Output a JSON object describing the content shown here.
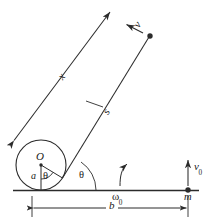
{
  "figure": {
    "kind": "mechanics-diagram",
    "stroke_color": "#2b2b2b",
    "background_color": "#ffffff",
    "width": 214,
    "height": 221
  },
  "labels": {
    "center": "O",
    "radius": "a",
    "angle_inner": "θ",
    "angle_outer": "θ",
    "string_length": "x",
    "arc_length": "s",
    "velocity": "v",
    "velocity_initial_symbol": "v",
    "velocity_initial_sub": "0",
    "omega_initial_symbol": "ω",
    "omega_initial_sub": "0",
    "mass": "m",
    "baseline_length": "b"
  },
  "geometry": {
    "circle": {
      "cx": 41,
      "cy": 165,
      "r": 25
    },
    "spool_center_dot": {
      "cx": 41,
      "cy": 165,
      "r": 1.6
    },
    "ground_line": {
      "x1": 13,
      "y1": 190,
      "x2": 199,
      "y2": 190
    },
    "radius_vertical": {
      "x1": 41,
      "y1": 165,
      "x2": 41,
      "y2": 190
    },
    "radius_tangent": {
      "x1": 41,
      "y1": 165,
      "x2": 62,
      "y2": 178
    },
    "string_upper": {
      "x1": 11,
      "y1": 145,
      "x2": 113,
      "y2": 9
    },
    "string_lower": {
      "x1": 62,
      "y1": 178,
      "x2": 150,
      "y2": 36
    },
    "mass_top_dot": {
      "cx": 150,
      "cy": 36,
      "r": 2.6
    },
    "mass_bottom_dot": {
      "cx": 188,
      "cy": 190,
      "r": 2.6
    },
    "velocity_arrow": {
      "x1": 141,
      "y1": 32,
      "x2": 126,
      "y2": 24
    },
    "velocity_initial_arrow": {
      "x1": 188,
      "y1": 186,
      "x2": 188,
      "y2": 161
    },
    "omega_arc": {
      "x": 119,
      "y": 163
    },
    "dimension_b": {
      "x1": 32,
      "x2": 188,
      "y": 208
    }
  }
}
